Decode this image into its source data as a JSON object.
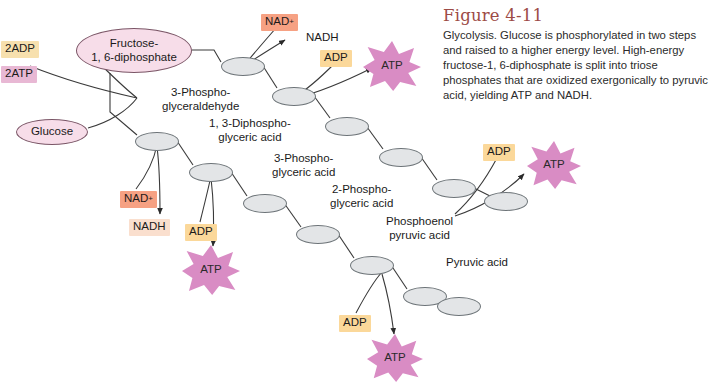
{
  "caption": {
    "title": "Figure 4-11",
    "body": "Glycolysis. Glucose is phosphorylated in two steps and raised to a higher energy level. High-energy fructose-1, 6-diphosphate is split into triose phosphates that are oxidized exergonically to pyruvic acid, yielding ATP and NADH."
  },
  "colors": {
    "title": "#9d4b46",
    "metabolite_fill": "#f7dde9",
    "metabolite_stroke": "#7a5566",
    "intermediate_fill": "#e3e5e7",
    "intermediate_stroke": "#6d7478",
    "adp_chip": "#fbd89a",
    "adp2_chip": "#f7e0ae",
    "atp2_chip": "#e8b8d4",
    "nad_chip": "#f6a183",
    "nadh_chip": "#fadfce",
    "atp_star": "#d98cc4",
    "arrow": "#3a3a3a"
  },
  "metabolites": [
    {
      "name": "glucose",
      "label": "Glucose",
      "x": 16,
      "y": 119,
      "w": 72,
      "h": 26
    },
    {
      "name": "fructose-1-6-diphosphate",
      "label": "Fructose-\n1, 6-diphosphate",
      "x": 76,
      "y": 28,
      "w": 116,
      "h": 45
    }
  ],
  "pathway_labels": [
    {
      "name": "3-phosphoglyceraldehyde",
      "label": "3-Phospho-\nglyceraldehyde",
      "x": 162,
      "y": 86
    },
    {
      "name": "1-3-diphosphoglyceric-acid",
      "label": "1, 3-Diphospho-\nglyceric acid",
      "x": 209,
      "y": 117
    },
    {
      "name": "3-phosphoglyceric-acid",
      "label": "3-Phospho-\nglyceric acid",
      "x": 272,
      "y": 152
    },
    {
      "name": "2-phosphoglyceric-acid",
      "label": "2-Phospho-\nglyceric acid",
      "x": 330,
      "y": 183
    },
    {
      "name": "phosphoenol-pyruvic-acid",
      "label": "Phosphoenol\npyruvic acid",
      "x": 386,
      "y": 215
    },
    {
      "name": "pyruvic-acid",
      "label": "Pyruvic acid",
      "x": 446,
      "y": 256
    }
  ],
  "reagents": [
    {
      "name": "2adp",
      "label": "2ADP",
      "style": "chip-adp2",
      "x": 1,
      "y": 41
    },
    {
      "name": "2atp",
      "label": "2ATP",
      "style": "chip-atp2",
      "x": 1,
      "y": 66
    },
    {
      "name": "nad-plus-top",
      "label": "NAD",
      "sup": "+",
      "style": "chip-nadp",
      "x": 261,
      "y": 14
    },
    {
      "name": "nadh-top",
      "label": "NADH",
      "style": "plain-label",
      "x": 306,
      "y": 31
    },
    {
      "name": "adp-top",
      "label": "ADP",
      "style": "chip-adp",
      "x": 320,
      "y": 50
    },
    {
      "name": "nad-plus-mid",
      "label": "NAD",
      "sup": "+",
      "style": "chip-nadp",
      "x": 120,
      "y": 191
    },
    {
      "name": "nadh-mid",
      "label": "NADH",
      "style": "chip-nadh",
      "x": 129,
      "y": 219
    },
    {
      "name": "adp-mid",
      "label": "ADP",
      "style": "chip-adp",
      "x": 185,
      "y": 224
    },
    {
      "name": "adp-right",
      "label": "ADP",
      "style": "chip-adp",
      "x": 483,
      "y": 144
    },
    {
      "name": "adp-bottom",
      "label": "ADP",
      "style": "chip-adp",
      "x": 339,
      "y": 315
    }
  ],
  "atp_stars": [
    {
      "name": "atp-top",
      "label": "ATP",
      "x": 363,
      "y": 41,
      "w": 58,
      "h": 50
    },
    {
      "name": "atp-right",
      "label": "ATP",
      "x": 527,
      "y": 141,
      "w": 54,
      "h": 48
    },
    {
      "name": "atp-mid",
      "label": "ATP",
      "x": 182,
      "y": 245,
      "w": 58,
      "h": 50
    },
    {
      "name": "atp-bottom",
      "label": "ATP",
      "x": 367,
      "y": 334,
      "w": 56,
      "h": 48
    }
  ],
  "intermediates": [
    {
      "name": "intermediate-1",
      "x": 221,
      "y": 57,
      "w": 44,
      "h": 19
    },
    {
      "name": "intermediate-2",
      "x": 272,
      "y": 87,
      "w": 44,
      "h": 19
    },
    {
      "name": "intermediate-3",
      "x": 325,
      "y": 117,
      "w": 44,
      "h": 19
    },
    {
      "name": "intermediate-4",
      "x": 379,
      "y": 148,
      "w": 44,
      "h": 19
    },
    {
      "name": "intermediate-5",
      "x": 432,
      "y": 179,
      "w": 44,
      "h": 19
    },
    {
      "name": "intermediate-6",
      "x": 135,
      "y": 132,
      "w": 44,
      "h": 19
    },
    {
      "name": "intermediate-7",
      "x": 189,
      "y": 163,
      "w": 44,
      "h": 19
    },
    {
      "name": "intermediate-8",
      "x": 243,
      "y": 194,
      "w": 44,
      "h": 19
    },
    {
      "name": "intermediate-9",
      "x": 296,
      "y": 225,
      "w": 44,
      "h": 19
    },
    {
      "name": "intermediate-10",
      "x": 350,
      "y": 256,
      "w": 44,
      "h": 19
    },
    {
      "name": "intermediate-11",
      "x": 403,
      "y": 287,
      "w": 44,
      "h": 19
    },
    {
      "name": "intermediate-12",
      "x": 106,
      "y": 72,
      "w": 0,
      "h": 0
    }
  ]
}
